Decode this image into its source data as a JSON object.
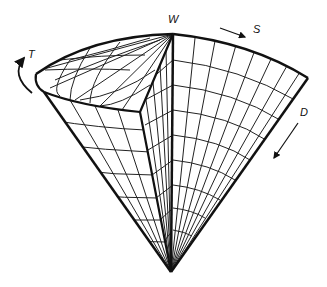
{
  "diagram": {
    "labels": {
      "w": "W",
      "s": "S",
      "t": "T",
      "d": "D"
    },
    "arrows": {
      "s": "straight arrow pointing toward S",
      "t": "curved arrow indicating rotation T",
      "d": "straight arrow pointing down along cone side D"
    },
    "colors": {
      "line": "#111111",
      "background": "#ffffff"
    }
  }
}
